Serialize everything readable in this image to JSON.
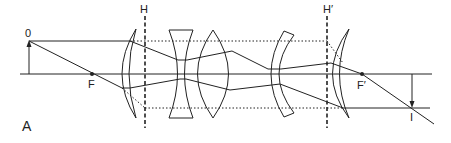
{
  "diagram": {
    "type": "optical-system-ray-diagram",
    "panel_label": "A",
    "labels": {
      "object": "0",
      "front_focal_point": "F",
      "front_principal_plane": "H",
      "rear_principal_plane": "H′",
      "rear_focal_point": "F′",
      "image": "I"
    },
    "colors": {
      "line": "#222222",
      "background": "#ffffff"
    },
    "elements": [
      {
        "name": "front-meniscus-lens",
        "kind": "positive meniscus"
      },
      {
        "name": "biconcave-lens",
        "kind": "negative"
      },
      {
        "name": "biconvex-lens",
        "kind": "positive"
      },
      {
        "name": "middle-meniscus-lens",
        "kind": "negative meniscus"
      },
      {
        "name": "rear-meniscus-lens",
        "kind": "positive meniscus"
      }
    ]
  }
}
